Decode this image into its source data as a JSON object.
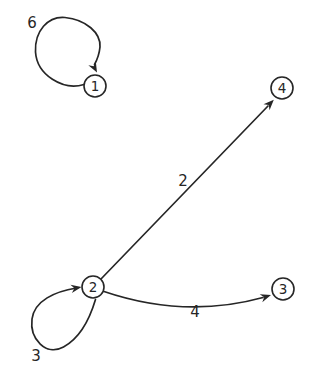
{
  "diagram": {
    "background_color": "#ffffff",
    "stroke_color": "#262626",
    "node_fill_color": "#ffffff",
    "canvas": {
      "width": 315,
      "height": 378
    },
    "node_radius": 11,
    "nodes": [
      {
        "id": "1",
        "label": "1",
        "x": 95,
        "y": 86
      },
      {
        "id": "2",
        "label": "2",
        "x": 93,
        "y": 287
      },
      {
        "id": "3",
        "label": "3",
        "x": 283,
        "y": 289
      },
      {
        "id": "4",
        "label": "4",
        "x": 282,
        "y": 88
      }
    ],
    "edges": [
      {
        "from": "1",
        "to": "1",
        "label": "6",
        "type": "self-loop-upper-left",
        "path": "M 84,84.5 C 63,91 37,75 35.5,52 C 34.5,31 48,16 65,17.5 C 86,19.5 101,33 100,47 C 99.3,54 97,60 94.5,64.5",
        "arrow": {
          "x": 97,
          "y": 72.5,
          "angle": 62
        },
        "label_pos": {
          "x": 32,
          "y": 28
        }
      },
      {
        "from": "2",
        "to": "4",
        "label": "2",
        "type": "straight",
        "path": "M 100.5,279.5 L 268,106",
        "arrow": {
          "x": 273.8,
          "y": 99.7,
          "angle": -46
        },
        "label_pos": {
          "x": 183,
          "y": 186
        }
      },
      {
        "from": "2",
        "to": "3",
        "label": "4",
        "type": "curved-down",
        "path": "M 104,291.5 Q 185,319 263,297.5",
        "arrow": {
          "x": 271,
          "y": 295,
          "angle": -18
        },
        "label_pos": {
          "x": 195,
          "y": 317
        }
      },
      {
        "from": "2",
        "to": "2",
        "label": "3",
        "type": "self-loop-lower-left",
        "path": "M 95.5,299.5 C 90,318 80,338 63.5,347 C 46,356.5 29.5,339 32,319 C 34.5,300.5 55,291.5 76.5,288",
        "arrow": {
          "x": 81.5,
          "y": 287,
          "angle": -10
        },
        "label_pos": {
          "x": 36,
          "y": 361
        }
      }
    ]
  }
}
